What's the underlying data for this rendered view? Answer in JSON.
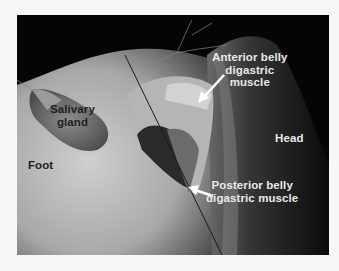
{
  "figure": {
    "labels": {
      "anterior_belly": {
        "line1": "Anterior belly",
        "line2": "digastric",
        "line3": "muscle"
      },
      "posterior_belly": {
        "line1": "Posterior belly",
        "line2": "digastric muscle"
      },
      "salivary_gland": {
        "line1": "Salivary",
        "line2": "gland"
      },
      "head": "Head",
      "foot": "Foot"
    },
    "colors": {
      "background": "#f7f7f7",
      "photo_dark": "#050505",
      "label_light": "#e9e9e9",
      "label_dark": "#1e1e1e"
    }
  }
}
